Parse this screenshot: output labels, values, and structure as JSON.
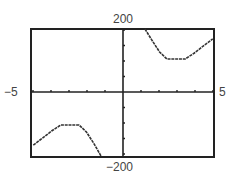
{
  "chart_data": {
    "type": "line",
    "title": "",
    "xlabel": "",
    "ylabel": "",
    "xlim": [
      -5,
      5
    ],
    "ylim": [
      -200,
      200
    ],
    "grid": false,
    "legend": null,
    "tick_labels": {
      "xmin": "−5",
      "xmax": "5",
      "ymax": "200",
      "ymin": "−200"
    },
    "x_ticks_count_each_side": 5,
    "y_ticks_count_each_side": 4,
    "series": [
      {
        "name": "left-branch",
        "x": [
          -4.9,
          -4.4,
          -3.9,
          -3.4,
          -2.9,
          -2.4,
          -2.0,
          -1.6,
          -1.2
        ],
        "y": [
          -166,
          -144,
          -122,
          -103,
          -103,
          -103,
          -125,
          -160,
          -200
        ]
      },
      {
        "name": "right-branch",
        "x": [
          1.2,
          1.6,
          2.0,
          2.4,
          2.9,
          3.4,
          3.9,
          4.4,
          4.9
        ],
        "y": [
          200,
          160,
          125,
          103,
          103,
          103,
          122,
          144,
          166
        ]
      }
    ]
  },
  "labels": {
    "top": "200",
    "bottom": "−200",
    "left": "−5",
    "right": "5"
  },
  "colors": {
    "frame": "#222222",
    "curve": "#333333",
    "label": "#444444"
  }
}
